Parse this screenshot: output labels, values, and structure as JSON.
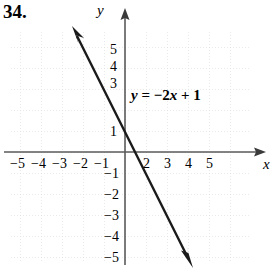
{
  "problem": {
    "number": "34."
  },
  "axes": {
    "x_letter": "x",
    "y_letter": "y",
    "x_arrow": "arrow-right-icon",
    "y_arrow": "arrow-up-icon"
  },
  "equation": {
    "lhs": "y",
    "equals": "=",
    "rhs_sign": "−",
    "rhs_coef": "2",
    "rhs_var": "x",
    "rhs_plus": "+",
    "rhs_const": "1",
    "full": "y = −2x + 1"
  },
  "colors": {
    "line": "#1a1a1a",
    "axis": "#555555",
    "grid": "#d8d8d8",
    "text": "#000000",
    "background": "#ffffff"
  },
  "chart_data": {
    "type": "line",
    "title": "",
    "xlabel": "x",
    "ylabel": "y",
    "equation": "y = -2x + 1",
    "slope": -2,
    "intercept": 1,
    "xlim": [
      -5.6,
      5.9
    ],
    "ylim": [
      -5.8,
      6.0
    ],
    "grid": true,
    "legend": "none",
    "annotations": [
      {
        "text": "y = −2x + 1",
        "x": 1.3,
        "y": 3.0
      }
    ],
    "line_endpoints": [
      {
        "x": -2.4,
        "y": 5.8
      },
      {
        "x": 3.0,
        "y": -5.0
      }
    ],
    "x_ticks": [
      -5,
      -4,
      -3,
      -2,
      -1,
      1,
      2,
      3,
      4,
      5
    ],
    "x_tick_labels": [
      "−5",
      "−4",
      "−3",
      "−2",
      "−1",
      "",
      "2",
      "3",
      "4",
      "5"
    ],
    "y_ticks": [
      5,
      4,
      3,
      2,
      1,
      -1,
      -2,
      -3,
      -4,
      -5
    ],
    "y_tick_labels": [
      "5",
      "4",
      "3",
      "",
      "1",
      "−1",
      "−2",
      "−3",
      "−4",
      "−5"
    ]
  },
  "x_axis_labels": [
    {
      "text": "−5",
      "left": 10,
      "top": 156
    },
    {
      "text": "−4",
      "left": 31,
      "top": 156
    },
    {
      "text": "−3",
      "left": 52,
      "top": 156
    },
    {
      "text": "−2",
      "left": 73,
      "top": 156
    },
    {
      "text": "−1",
      "left": 94,
      "top": 156
    },
    {
      "text": "2",
      "left": 143,
      "top": 156
    },
    {
      "text": "3",
      "left": 164,
      "top": 156
    },
    {
      "text": "4",
      "left": 185,
      "top": 156
    },
    {
      "text": "5",
      "left": 206,
      "top": 156
    }
  ],
  "y_axis_labels": [
    {
      "text": "5",
      "left": 110,
      "top": 42
    },
    {
      "text": "4",
      "left": 110,
      "top": 59
    },
    {
      "text": "3",
      "left": 110,
      "top": 76
    },
    {
      "text": "1",
      "left": 110,
      "top": 124
    },
    {
      "text": "−1",
      "left": 104,
      "top": 166
    },
    {
      "text": "−2",
      "left": 104,
      "top": 187
    },
    {
      "text": "−3",
      "left": 104,
      "top": 208
    },
    {
      "text": "−4",
      "left": 104,
      "top": 229
    },
    {
      "text": "−5",
      "left": 104,
      "top": 250
    }
  ]
}
